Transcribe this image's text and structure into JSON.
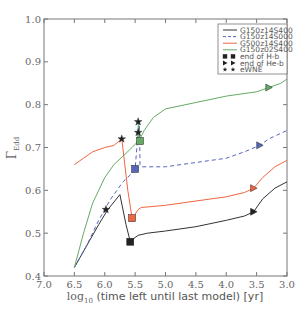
{
  "chart_data": {
    "type": "line",
    "title": "",
    "xlabel": "log10 (time left until last model) [yr]",
    "xlabel_main": "log",
    "xlabel_sub": "10",
    "xlabel_rest": " (time left until last model) [yr]",
    "ylabel": "Γ_Edd",
    "ylabel_main": "Γ",
    "ylabel_sub": "Edd",
    "xlim": [
      7.0,
      3.0
    ],
    "ylim": [
      0.4,
      1.0
    ],
    "x_inverted": true,
    "grid": false,
    "legend_position": "upper right",
    "xticks": [
      "7.0",
      "6.5",
      "6.0",
      "5.5",
      "5.0",
      "4.5",
      "4.0",
      "3.5",
      "3.0"
    ],
    "yticks": [
      "0.4",
      "0.5",
      "0.6",
      "0.7",
      "0.8",
      "0.9",
      "1.0"
    ],
    "series": [
      {
        "name": "G150z14S400",
        "color": "#333333",
        "style": "solid",
        "points": [
          [
            6.5,
            0.42
          ],
          [
            6.3,
            0.47
          ],
          [
            6.1,
            0.52
          ],
          [
            5.95,
            0.555
          ],
          [
            5.75,
            0.59
          ],
          [
            5.65,
            0.52
          ],
          [
            5.58,
            0.48
          ],
          [
            5.5,
            0.49
          ],
          [
            5.45,
            0.495
          ],
          [
            5.3,
            0.5
          ],
          [
            5.0,
            0.505
          ],
          [
            4.5,
            0.515
          ],
          [
            4.0,
            0.53
          ],
          [
            3.7,
            0.54
          ],
          [
            3.55,
            0.55
          ],
          [
            3.4,
            0.58
          ],
          [
            3.2,
            0.605
          ],
          [
            3.0,
            0.62
          ]
        ],
        "end_H_b": [
          5.58,
          0.48
        ],
        "end_He_b": [
          3.55,
          0.55
        ],
        "eWNE": [
          5.98,
          0.555
        ]
      },
      {
        "name": "G150z14S000",
        "color": "#5566bb",
        "style": "dashed",
        "points": [
          [
            6.5,
            0.42
          ],
          [
            6.3,
            0.47
          ],
          [
            6.1,
            0.53
          ],
          [
            5.9,
            0.58
          ],
          [
            5.7,
            0.62
          ],
          [
            5.55,
            0.64
          ],
          [
            5.5,
            0.65
          ],
          [
            5.47,
            0.7
          ],
          [
            5.45,
            0.735
          ],
          [
            5.43,
            0.76
          ],
          [
            5.42,
            0.66
          ],
          [
            5.4,
            0.655
          ],
          [
            5.0,
            0.655
          ],
          [
            4.5,
            0.665
          ],
          [
            4.0,
            0.675
          ],
          [
            3.7,
            0.69
          ],
          [
            3.45,
            0.705
          ],
          [
            3.3,
            0.72
          ],
          [
            3.0,
            0.74
          ]
        ],
        "end_H_b": [
          5.5,
          0.65
        ],
        "end_He_b": [
          3.45,
          0.705
        ],
        "eWNE": [
          5.45,
          0.735
        ]
      },
      {
        "name": "G500z14S400",
        "color": "#ee6644",
        "style": "solid",
        "points": [
          [
            6.5,
            0.66
          ],
          [
            6.35,
            0.675
          ],
          [
            6.2,
            0.69
          ],
          [
            6.0,
            0.7
          ],
          [
            5.85,
            0.705
          ],
          [
            5.72,
            0.72
          ],
          [
            5.62,
            0.6
          ],
          [
            5.55,
            0.535
          ],
          [
            5.52,
            0.54
          ],
          [
            5.45,
            0.555
          ],
          [
            5.4,
            0.56
          ],
          [
            5.0,
            0.565
          ],
          [
            4.5,
            0.575
          ],
          [
            4.0,
            0.585
          ],
          [
            3.7,
            0.595
          ],
          [
            3.55,
            0.605
          ],
          [
            3.4,
            0.63
          ],
          [
            3.2,
            0.655
          ],
          [
            3.0,
            0.67
          ]
        ],
        "end_H_b": [
          5.55,
          0.535
        ],
        "end_He_b": [
          3.55,
          0.605
        ],
        "eWNE": [
          5.72,
          0.72
        ]
      },
      {
        "name": "G150z02S400",
        "color": "#66aa66",
        "style": "solid",
        "points": [
          [
            6.5,
            0.42
          ],
          [
            6.35,
            0.5
          ],
          [
            6.2,
            0.57
          ],
          [
            6.0,
            0.63
          ],
          [
            5.85,
            0.66
          ],
          [
            5.7,
            0.68
          ],
          [
            5.55,
            0.7
          ],
          [
            5.45,
            0.715
          ],
          [
            5.45,
            0.76
          ],
          [
            5.42,
            0.72
          ],
          [
            5.35,
            0.74
          ],
          [
            5.2,
            0.77
          ],
          [
            5.0,
            0.79
          ],
          [
            4.5,
            0.805
          ],
          [
            4.0,
            0.82
          ],
          [
            3.5,
            0.83
          ],
          [
            3.3,
            0.84
          ],
          [
            3.1,
            0.85
          ],
          [
            3.0,
            0.86
          ]
        ],
        "end_H_b": [
          5.42,
          0.715
        ],
        "end_He_b": [
          3.3,
          0.84
        ],
        "eWNE": [
          5.45,
          0.76
        ]
      }
    ],
    "legend": [
      {
        "label": "G150z14S400",
        "kind": "line",
        "color": "#333333",
        "style": "solid"
      },
      {
        "label": "G150z14S000",
        "kind": "line",
        "color": "#5566bb",
        "style": "dashed"
      },
      {
        "label": "G500z14S400",
        "kind": "line",
        "color": "#ee6644",
        "style": "solid"
      },
      {
        "label": "G150z02S400",
        "kind": "line",
        "color": "#66aa66",
        "style": "solid"
      },
      {
        "label": "end of H-b",
        "kind": "marker",
        "marker": "square",
        "color": "#222222"
      },
      {
        "label": "end of He-b",
        "kind": "marker",
        "marker": "triangle-right",
        "color": "#222222"
      },
      {
        "label": "eWNE",
        "kind": "marker",
        "marker": "star",
        "color": "#222222"
      }
    ]
  }
}
